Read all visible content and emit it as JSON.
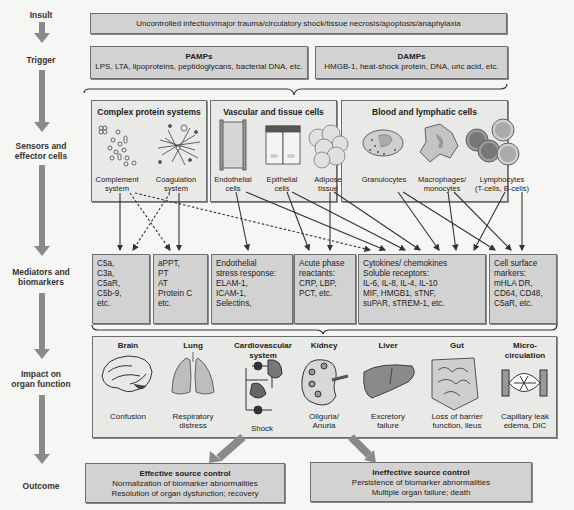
{
  "stages": [
    {
      "id": "insult",
      "label": "Insult"
    },
    {
      "id": "trigger",
      "label": "Trigger"
    },
    {
      "id": "sensors",
      "label_line1": "Sensors and",
      "label_line2": "effector cells"
    },
    {
      "id": "mediators",
      "label_line1": "Mediators and",
      "label_line2": "biomarkers"
    },
    {
      "id": "impact",
      "label_line1": "Impact on",
      "label_line2": "organ function"
    },
    {
      "id": "outcome",
      "label": "Outcome"
    }
  ],
  "insult": {
    "text": "Uncontrolled infection/major trauma/circulatory shock/tissue necrosis/apoptosis/anaphylaxia"
  },
  "trigger": {
    "pamps": {
      "title": "PAMPs",
      "text": "LPS, LTA, lipoproteins, peptidoglycans, bacterial DNA, etc."
    },
    "damps": {
      "title": "DAMPs",
      "text": "HMGB-1, heat-shock protein, DNA, uric acid, etc."
    }
  },
  "sensors": {
    "complex_protein": {
      "title": "Complex protein systems",
      "items": [
        {
          "line1": "Complement",
          "line2": "system"
        },
        {
          "line1": "Coagulation",
          "line2": "system"
        }
      ]
    },
    "vascular": {
      "title": "Vascular and tissue cells",
      "items": [
        {
          "line1": "Endothelial",
          "line2": "cells"
        },
        {
          "line1": "Epithelial",
          "line2": "cells"
        },
        {
          "line1": "Adipose",
          "line2": "tissue"
        }
      ]
    },
    "blood": {
      "title": "Blood and lymphatic cells",
      "items": [
        {
          "line1": "Granulocytes",
          "line2": ""
        },
        {
          "line1": "Macrophages/",
          "line2": "monocytes"
        },
        {
          "line1": "Lymphocytes",
          "line2": "(T-cells, B-cells)"
        }
      ]
    }
  },
  "mediators": [
    {
      "lines": [
        "C5a,",
        "C3a,",
        "C5aR,",
        "C5b-9,",
        "etc."
      ]
    },
    {
      "lines": [
        "aPPT,",
        "PT",
        "AT",
        "Protein C",
        "etc."
      ]
    },
    {
      "lines": [
        "Endothelial",
        "stress response:",
        "ELAM-1,",
        "ICAM-1,",
        "Selectins,"
      ]
    },
    {
      "lines": [
        "Acute phase",
        "reactants:",
        "CRP, LBP,",
        "PCT, etc."
      ]
    },
    {
      "lines": [
        "Cytokines/ chemokines",
        "Soluble receptors:",
        "IL-6, IL-8, IL-4, IL-10",
        "MIF, HMGB1, sTNF,",
        "suPAR, sTREM-1, etc."
      ]
    },
    {
      "lines": [
        "Cell surface",
        "markers:",
        "mHLA DR,",
        "CD64, CD48,",
        "C5aR, etc."
      ]
    }
  ],
  "organs": [
    {
      "name": "Brain",
      "name2": "",
      "effect1": "Confusion",
      "effect2": ""
    },
    {
      "name": "Lung",
      "name2": "",
      "effect1": "Respiratory",
      "effect2": "distress"
    },
    {
      "name": "Cardiovascular",
      "name2": "system",
      "effect1": "Shock",
      "effect2": ""
    },
    {
      "name": "Kidney",
      "name2": "",
      "effect1": "Oliguria/",
      "effect2": "Anuria"
    },
    {
      "name": "Liver",
      "name2": "",
      "effect1": "Excretory",
      "effect2": "failure"
    },
    {
      "name": "Gut",
      "name2": "",
      "effect1": "Loss of barrier",
      "effect2": "function, ileus"
    },
    {
      "name": "Micro-",
      "name2": "circulation",
      "effect1": "Capillary leak",
      "effect2": "edema, DIC"
    }
  ],
  "outcomes": {
    "effective": {
      "title": "Effective source control",
      "line1": "Normalization of biomarker abnormalities",
      "line2": "Resolution of organ dysfunction; recovery"
    },
    "ineffective": {
      "title": "Ineffective source control",
      "line1": "Persistence of biomarker abnormalities",
      "line2": "Multiple organ failure; death"
    }
  },
  "colors": {
    "box_fill": "#d2d2d2",
    "light_box_fill": "#e9e9e7",
    "arrow": "#8a8a8a",
    "line": "#333333"
  }
}
